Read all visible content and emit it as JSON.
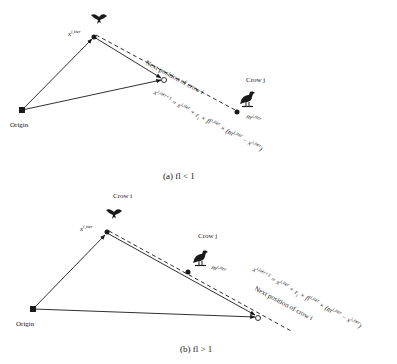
{
  "panel_a": {
    "caption": "(a) fl < 1",
    "origin_label": "Origin",
    "crow_j_label": "Crow j",
    "current_position_label": "x",
    "current_position_sup": "i,iter",
    "memory_label": "m",
    "memory_sup": "j,iter",
    "next_position_label": "Next position of crow i",
    "formula": "x^{i,iter+1} = x^{i,iter} + r_i × fl^{i,iter} × (m^{j,iter} − x^{i,iter})",
    "formula_parts": {
      "lhs": "x",
      "lhs_sup": "i,iter+1",
      "eq": " = x",
      "eq_sup": "i,iter",
      "plus": " + r",
      "plus_sub": "i",
      "times_fl": " × fl",
      "fl_sup": "i,iter",
      "times_paren": " × (m",
      "m_sup": "j,iter",
      "minus": " − x",
      "x_sup": "i,iter",
      "close": ")"
    }
  },
  "panel_b": {
    "caption": "(b) fl > 1",
    "origin_label": "Origin",
    "crow_i_label": "Crow i",
    "crow_j_label": "Crow j",
    "current_position_label": "x",
    "current_position_sup": "i,iter",
    "memory_label": "m",
    "memory_sup": "j,iter",
    "next_position_label": "Next position of crow i",
    "formula": "x^{i,iter+1} = x^{i,iter} + r_i × fl^{i,iter} × (m^{j,iter} − x^{i,iter})",
    "formula_parts": {
      "lhs": "x",
      "lhs_sup": "i,iter+1",
      "eq": " = x",
      "eq_sup": "i,iter",
      "plus": " + r",
      "plus_sub": "i",
      "times_fl": " × fl",
      "fl_sup": "i,iter",
      "times_paren": " × (m",
      "m_sup": "j,iter",
      "minus": " − x",
      "x_sup": "i,iter",
      "close": ")"
    }
  },
  "colors": {
    "line": "#1a1a1a",
    "background": "#ffffff"
  }
}
